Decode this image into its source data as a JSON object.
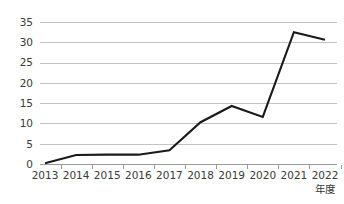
{
  "chart_data": {
    "type": "line",
    "title": "",
    "subtitle": "",
    "xlabel": "年度",
    "ylabel": "",
    "categories": [
      "2013",
      "2014",
      "2015",
      "2016",
      "2017",
      "2018",
      "2019",
      "2020",
      "2021",
      "2022"
    ],
    "values": [
      0.2,
      2.2,
      2.3,
      2.3,
      3.4,
      10.3,
      14.3,
      11.6,
      32.5,
      30.6
    ],
    "series": [
      {
        "name": "",
        "values": [
          0.2,
          2.2,
          2.3,
          2.3,
          3.4,
          10.3,
          14.3,
          11.6,
          32.5,
          30.6
        ],
        "color": "#1a1a1a"
      }
    ],
    "ylim": [
      0,
      35
    ],
    "yticks": [
      0,
      5,
      10,
      15,
      20,
      25,
      30,
      35
    ],
    "ytick_labels": [
      "0",
      "5",
      "10",
      "15",
      "20",
      "25",
      "30",
      "35"
    ],
    "xtick_labels": [
      "2013",
      "2014",
      "2015",
      "2016",
      "2017",
      "2018",
      "2019",
      "2020",
      "2021",
      "2022"
    ],
    "grid": true,
    "grid_axis": "y",
    "legend": false,
    "legend_position": "none",
    "markers": false,
    "annotations": []
  },
  "axis": {
    "x_title": "年度"
  },
  "colors": {
    "line": "#1a1a1a",
    "gridline": "#bdbdbd",
    "axis": "#9a9a9a",
    "tick_text": "#3a3a3a",
    "background": "#ffffff"
  }
}
